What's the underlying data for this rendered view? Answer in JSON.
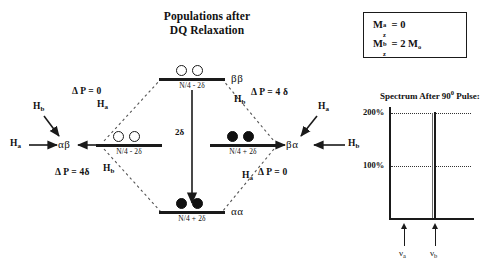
{
  "title": {
    "line1": "Populations after",
    "line2": "DQ Relaxation"
  },
  "magnetization_box": {
    "row_a": {
      "symbol": "M",
      "superscript": "a",
      "subscript": "z",
      "equals": "=",
      "value": "0"
    },
    "row_b": {
      "symbol": "M",
      "superscript": "b",
      "subscript": "z",
      "equals": "=",
      "value": "2 M",
      "value_sub": "o"
    }
  },
  "levels": {
    "top": {
      "state": "ββ",
      "population": "N/4 - 2δ",
      "circles": [
        "open",
        "open"
      ]
    },
    "left": {
      "state": "αβ",
      "population": "N/4 - 2δ",
      "circles": [
        "open",
        "open"
      ]
    },
    "right": {
      "state": "βα",
      "population": "N/4 + 2δ",
      "circles": [
        "filled",
        "filled"
      ]
    },
    "bottom": {
      "state": "αα",
      "population": "N/4 + 2δ",
      "circles": [
        "filled",
        "filled"
      ]
    }
  },
  "transitions": {
    "upper_left": {
      "delta_p": "Δ P = 0",
      "nucleus": "H",
      "nucleus_sub": "a"
    },
    "upper_right": {
      "delta_p": "Δ P = 4 δ",
      "nucleus": "H",
      "nucleus_sub": "b"
    },
    "lower_left": {
      "delta_p": "Δ P = 4δ",
      "nucleus": "H",
      "nucleus_sub": "b"
    },
    "lower_right": {
      "delta_p": "Δ P = 0",
      "nucleus": "H",
      "nucleus_sub": "a"
    },
    "center_arrow_label": "2δ"
  },
  "side_arrows": {
    "left_diagonal": {
      "nucleus": "H",
      "nucleus_sub": "b"
    },
    "left_horizontal": {
      "nucleus": "H",
      "nucleus_sub": "a"
    },
    "right_diagonal": {
      "nucleus": "H",
      "nucleus_sub": "a"
    },
    "right_horizontal": {
      "nucleus": "H",
      "nucleus_sub": "b"
    }
  },
  "spectrum": {
    "title": "Spectrum After 90",
    "title_superscript": "0",
    "title_suffix": " Pulse:",
    "gridline_200": "200%",
    "gridline_100": "100%",
    "peak_label_a": "ν",
    "peak_label_a_sub": "a",
    "peak_label_b": "ν",
    "peak_label_b_sub": "b"
  },
  "colors": {
    "ink": "#1a1a1a",
    "background": "#ffffff"
  }
}
